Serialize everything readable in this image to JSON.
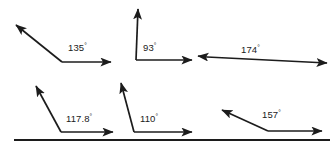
{
  "figure": {
    "canvas": {
      "width": 336,
      "height": 151,
      "background": "#ffffff"
    },
    "stroke_color": "#1c1c1c",
    "text_color": "#1a1a1a",
    "degree_symbol": "°",
    "rows": [
      {
        "name": "top-row",
        "angles": [
          {
            "id": "angle-135",
            "value": "135",
            "label": "135°"
          },
          {
            "id": "angle-93",
            "value": "93",
            "label": "93°"
          },
          {
            "id": "angle-174",
            "value": "174",
            "label": "174°"
          }
        ]
      },
      {
        "name": "bottom-row",
        "angles": [
          {
            "id": "angle-117-8",
            "value": "117.8",
            "label": "117.8°"
          },
          {
            "id": "angle-110",
            "value": "110",
            "label": "110°"
          },
          {
            "id": "angle-157",
            "value": "157",
            "label": "157°"
          }
        ]
      }
    ],
    "labels": {
      "a135_num": "135",
      "a135_deg": "°",
      "a93_num": "93",
      "a93_deg": "°",
      "a174_num": "174",
      "a174_deg": "°",
      "a117_num": "117.8",
      "a117_deg": "°",
      "a110_num": "110",
      "a110_deg": "°",
      "a157_num": "157",
      "a157_deg": "°"
    }
  }
}
